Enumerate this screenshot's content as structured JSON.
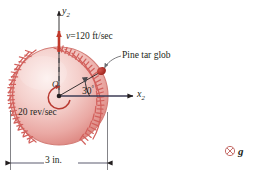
{
  "figure": {
    "background_color": "#ffffff",
    "ball_color_light": "#f7d9d6",
    "ball_color_mid": "#eeaaa6",
    "ball_color_dark": "#d9736e",
    "seam_color": "#d2605c",
    "accent_color": "#c0392b",
    "line_color": "#231f20",
    "glob_color": "#b62a22"
  },
  "labels": {
    "y_axis": "y",
    "y_axis_sub": "2",
    "x_axis": "x",
    "x_axis_sub": "2",
    "velocity": "v=120 ft/sec",
    "velocity_symbol": "v",
    "velocity_value": "120",
    "velocity_units": "ft/sec",
    "pine_tar": "Pine tar glob",
    "origin": "O",
    "angle": "30°",
    "angle_value": "30",
    "spin": "20 rev/sec",
    "spin_value": "20",
    "spin_units": "rev/sec",
    "diameter": "3 in.",
    "diameter_value": "3",
    "diameter_units": "in.",
    "gravity": "g",
    "gravity_marker": "circled-x-into-page"
  },
  "geometry": {
    "ball_center_x": 59,
    "ball_center_y": 96,
    "ball_radius": 49,
    "glob_angle_deg": 30,
    "x_axis_end": 133,
    "y_axis_top": 11,
    "dimension_line_y": 163
  }
}
